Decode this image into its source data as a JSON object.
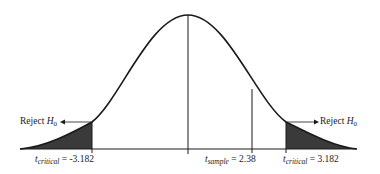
{
  "diagram": {
    "type": "two-tailed t-distribution hypothesis test",
    "curve": "bell-shaped t-distribution",
    "left_reject_label": {
      "prefix": "Reject ",
      "var": "H",
      "sub": "0"
    },
    "right_reject_label": {
      "prefix": "Reject ",
      "var": "H",
      "sub": "0"
    },
    "left_critical": {
      "var": "t",
      "sub": "critical",
      "eq": " = ",
      "value": "-3.182"
    },
    "sample": {
      "var": "t",
      "sub": "sample",
      "eq": " = ",
      "value": "2.38"
    },
    "right_critical": {
      "var": "t",
      "sub": "critical",
      "eq": " = ",
      "value": "3.182"
    },
    "colors": {
      "line": "#1a1a1a",
      "shade": "#3a3a3a",
      "background": "#ffffff"
    }
  }
}
